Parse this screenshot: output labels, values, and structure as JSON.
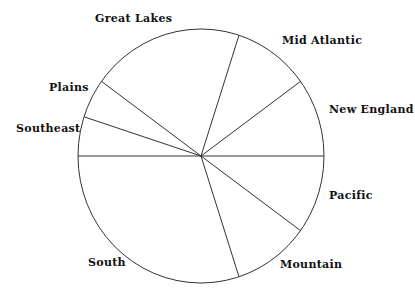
{
  "chart_data": {
    "type": "pie",
    "title": "",
    "start_angle_deg": 0,
    "direction": "counterclockwise",
    "slices": [
      {
        "label": "New England",
        "value": 10
      },
      {
        "label": "Mid Atlantic",
        "value": 10
      },
      {
        "label": "Great Lakes",
        "value": 20
      },
      {
        "label": "Plains",
        "value": 5
      },
      {
        "label": "Southeast",
        "value": 5
      },
      {
        "label": "South",
        "value": 30
      },
      {
        "label": "Mountain",
        "value": 10
      },
      {
        "label": "Pacific",
        "value": 10
      }
    ],
    "categories": [
      "New England",
      "Mid Atlantic",
      "Great Lakes",
      "Plains",
      "Southeast",
      "South",
      "Mountain",
      "Pacific"
    ],
    "values": [
      10,
      10,
      20,
      5,
      5,
      30,
      10,
      10
    ],
    "legend": "none (labels placed outside slices)",
    "fill": "none (outline only)"
  },
  "labels": {
    "new_england": "New England",
    "mid_atlantic": "Mid Atlantic",
    "great_lakes": "Great Lakes",
    "plains": "Plains",
    "southeast": "Southeast",
    "south": "South",
    "mountain": "Mountain",
    "pacific": "Pacific"
  },
  "colors": {
    "stroke": "#333333",
    "background": "#ffffff",
    "text": "#111111"
  }
}
